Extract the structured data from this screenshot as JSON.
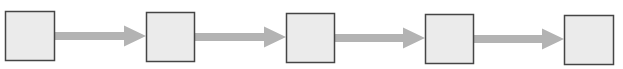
{
  "diagram": {
    "type": "linear-flow",
    "colors": {
      "box_fill": "#ebebeb",
      "box_border": "#454545",
      "arrow": "#b3b3b3",
      "background": "#ffffff"
    },
    "nodes": [
      {
        "id": "box-1",
        "label": "",
        "x": 5,
        "y": 11,
        "w": 50,
        "h": 50
      },
      {
        "id": "box-2",
        "label": "",
        "x": 146,
        "y": 12,
        "w": 49,
        "h": 50
      },
      {
        "id": "box-3",
        "label": "",
        "x": 286,
        "y": 13,
        "w": 49,
        "h": 50
      },
      {
        "id": "box-4",
        "label": "",
        "x": 425,
        "y": 14,
        "w": 49,
        "h": 50
      },
      {
        "id": "box-5",
        "label": "",
        "x": 564,
        "y": 15,
        "w": 50,
        "h": 50
      }
    ],
    "edges": [
      {
        "from": "box-1",
        "to": "box-2",
        "x1": 55,
        "x2": 146,
        "y": 36
      },
      {
        "from": "box-2",
        "to": "box-3",
        "x1": 195,
        "x2": 286,
        "y": 37
      },
      {
        "from": "box-3",
        "to": "box-4",
        "x1": 335,
        "x2": 425,
        "y": 38
      },
      {
        "from": "box-4",
        "to": "box-5",
        "x1": 474,
        "x2": 564,
        "y": 39
      }
    ]
  }
}
